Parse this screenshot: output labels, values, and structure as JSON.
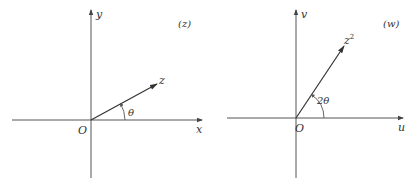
{
  "panels": [
    {
      "id": "z-plane",
      "plane_label": "(z)",
      "origin_label": "O",
      "x_axis_label": "x",
      "y_axis_label": "y",
      "vector_label": "z",
      "angle_label": "θ",
      "angle_deg": 29
    },
    {
      "id": "w-plane",
      "plane_label": "(w)",
      "origin_label": "O",
      "x_axis_label": "u",
      "y_axis_label": "v",
      "vector_label": "z",
      "vector_superscript": "2",
      "angle_label": "2θ",
      "angle_deg": 58
    }
  ],
  "colors": {
    "axis": "#555555",
    "vector": "#333333",
    "text": "#333333",
    "background": "#ffffff"
  }
}
